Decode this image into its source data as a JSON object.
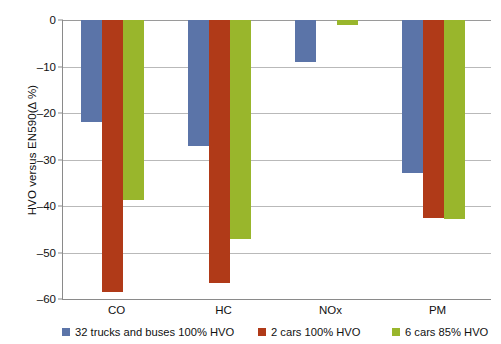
{
  "chart_data": {
    "type": "bar",
    "title": "",
    "subtitle": "",
    "xlabel": "",
    "ylabel": "HVO versus EN590(Δ %)",
    "categories": [
      "CO",
      "HC",
      "NOx",
      "PM"
    ],
    "series": [
      {
        "name": "32 trucks and buses 100% HVO",
        "color": "#5b74a8",
        "values": [
          -22,
          -27,
          -9,
          -33
        ]
      },
      {
        "name": "2 cars 100% HVO",
        "color": "#b03a18",
        "values": [
          -58.5,
          -56.5,
          0,
          -42.5
        ]
      },
      {
        "name": "6 cars 85% HVO",
        "color": "#99b62c",
        "values": [
          -38.7,
          -47,
          -1,
          -42.8
        ]
      }
    ],
    "ylim": [
      -60,
      0
    ],
    "y_ticks": [
      0,
      -10,
      -20,
      -30,
      -40,
      -50,
      -60
    ],
    "y_tick_labels": [
      "0",
      "–10",
      "–20",
      "–30",
      "–40",
      "–50",
      "–60"
    ],
    "grid": true,
    "legend_position": "bottom",
    "axis_color": "#8a8a8a",
    "grid_color": "#b9b9b9"
  },
  "legend": {
    "entries": [
      {
        "label": "32 trucks and buses 100% HVO",
        "color": "#5b74a8"
      },
      {
        "label": "2 cars 100% HVO",
        "color": "#b03a18"
      },
      {
        "label": "6 cars 85% HVO",
        "color": "#99b62c"
      }
    ]
  }
}
